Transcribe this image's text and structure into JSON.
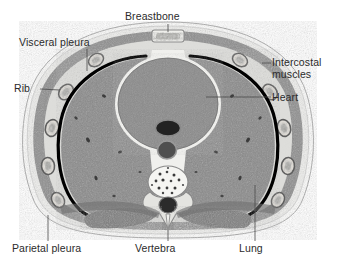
{
  "figure": {
    "type": "anatomical-ct-cross-section",
    "region": "thorax",
    "background_color": "#ffffff",
    "label_color": "#2b2b2b",
    "leader_line_color": "#555555"
  },
  "labels": {
    "breastbone": "Breastbone",
    "visceral_pleura": "Visceral pleura",
    "rib": "Rib",
    "intercostal_muscles": "Intercostal\nmuscles",
    "intercostal_muscles_line1": "Intercostal",
    "intercostal_muscles_line2": "muscles",
    "heart": "Heart",
    "parietal_pleura": "Parietal pleura",
    "vertebra": "Vertebra",
    "lung": "Lung"
  },
  "structures": {
    "body_wall": {
      "name": "chest wall",
      "fill": "#8f8f8f"
    },
    "subcutaneous_fat": {
      "name": "subcutaneous fat",
      "fill": "#e8e8e6"
    },
    "skin_outline": {
      "name": "skin",
      "stroke": "#9a9a9a"
    },
    "lung_left": {
      "name": "left lung",
      "fill": "#8a8a8a"
    },
    "lung_right": {
      "name": "right lung",
      "fill": "#8a8a8a"
    },
    "pleura_line": {
      "name": "pleural line",
      "stroke": "#000000"
    },
    "heart": {
      "name": "heart",
      "fill": "#8b8b8b"
    },
    "sternum": {
      "name": "breastbone",
      "fill": "#ededea"
    },
    "vertebral_body": {
      "name": "vertebral body",
      "fill": "#f2f2ef"
    },
    "spinal_canal": {
      "name": "spinal canal",
      "fill": "#2e2e2e"
    },
    "aorta": {
      "name": "descending aorta",
      "fill": "#4a4a4a"
    },
    "esophagus": {
      "name": "esophagus / vessel",
      "fill": "#262626"
    },
    "back_muscles": {
      "name": "paraspinal muscles",
      "fill": "#7a7a7a"
    },
    "ribs": {
      "name": "rib cross-sections",
      "fill": "#dcdcd8",
      "stroke": "#6d6d6d",
      "count_left": 5,
      "count_right": 5
    }
  }
}
